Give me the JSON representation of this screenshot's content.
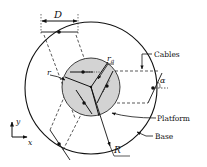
{
  "diagram": {
    "type": "cable-driven parallel platform schematic",
    "labels": {
      "D": "D",
      "r": "r",
      "r_a": "r",
      "r_a_sub": "a",
      "alpha": "α",
      "R": "R",
      "cables": "Cables",
      "platform": "Platform",
      "base": "Base",
      "axis_x": "x",
      "axis_y": "y"
    },
    "colors": {
      "stroke": "#111111",
      "platform_fill": "#d3d3d3",
      "background": "#ffffff"
    },
    "geometry": {
      "base_circle": {
        "cx": 91,
        "cy": 88,
        "r": 66
      },
      "platform_circle": {
        "cx": 91,
        "cy": 87,
        "r": 29
      }
    }
  }
}
